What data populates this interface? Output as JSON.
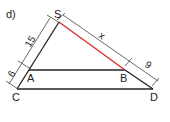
{
  "problem_label": "d)",
  "points": {
    "S": "S",
    "A": "A",
    "B": "B",
    "C": "C",
    "D": "D"
  },
  "dimensions": {
    "SA": "15",
    "AC": "6",
    "SB": "x",
    "BD": "9"
  },
  "colors": {
    "line": "#222222",
    "highlight": "#e03030",
    "dimension": "#444444"
  }
}
